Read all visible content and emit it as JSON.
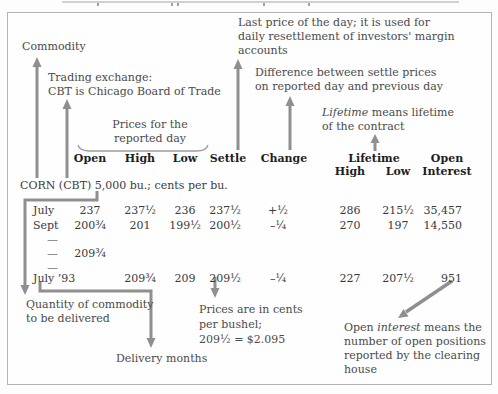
{
  "corn_line": "CORN (CBT) 5,000 bu.; cents per bu.",
  "annotations": {
    "commodity": {
      "text": "Commodity"
    },
    "exchange": {
      "line1": "Trading exchange:",
      "line2": "CBT is Chicago Board of Trade"
    },
    "prices_reported": {
      "line1": "Prices for the",
      "line2": "reported day"
    },
    "settle_note": {
      "line1": "Last price of the day; it is used for",
      "line2": "daily resettlement of investors' margin",
      "line3": "accounts"
    },
    "change_note": {
      "line1": "Difference between settle prices",
      "line2": "on reported day and previous day"
    },
    "lifetime_note": {
      "italic_word": "Lifetime",
      "line1_rest": " means lifetime",
      "line2": "of the contract"
    },
    "quantity_note": {
      "line1": "Quantity of commodity",
      "line2": "to be delivered"
    },
    "delivery_note": {
      "text": "Delivery months"
    },
    "cents_note": {
      "line1": "Prices are in cents",
      "line2": "per bushel;",
      "line3": "209½ = $2.095"
    },
    "open_interest_note": {
      "line1_pre": "Open ",
      "italic_word": "interest",
      "line1_rest": " means the",
      "line2": "number of open positions",
      "line3": "reported by the clearing",
      "line4": "house"
    }
  },
  "table": {
    "headers": {
      "open": "Open",
      "high": "High",
      "low": "Low",
      "settle": "Settle",
      "change": "Change",
      "lifetime": "Lifetime",
      "lifetime_high": "High",
      "lifetime_low": "Low",
      "open_interest_line1": "Open",
      "open_interest_line2": "Interest"
    },
    "rows": [
      {
        "month": "July",
        "open": "237",
        "high": "237½",
        "low": "236",
        "settle": "237½",
        "change": "+½",
        "lt_high": "286",
        "lt_low": "215½",
        "oi": "35,457"
      },
      {
        "month": "Sept",
        "open": "200¾",
        "high": "201",
        "low": "199½",
        "settle": "200½",
        "change": "–¼",
        "lt_high": "270",
        "lt_low": "197",
        "oi": "14,550"
      },
      {
        "month": "—",
        "open": "",
        "high": "",
        "low": "",
        "settle": "",
        "change": "",
        "lt_high": "",
        "lt_low": "",
        "oi": ""
      },
      {
        "month": "—",
        "open": "209¾",
        "high": "",
        "low": "",
        "settle": "",
        "change": "",
        "lt_high": "",
        "lt_low": "",
        "oi": ""
      },
      {
        "month": "—",
        "open": "",
        "high": "",
        "low": "",
        "settle": "",
        "change": "",
        "lt_high": "",
        "lt_low": "",
        "oi": ""
      },
      {
        "month": "July ’93",
        "open": "",
        "high": "209¾",
        "low": "209",
        "settle": "209½",
        "change": "–¼",
        "lt_high": "227",
        "lt_low": "207½",
        "oi": "951"
      }
    ]
  },
  "colors": {
    "arrow": "#8f8f8f",
    "annotation_text": "#4a4a4a",
    "table_text": "#3a3a3a",
    "header_text": "#1d1d1d",
    "frame_border": "#b3b3b3",
    "background": "#fdfdfd"
  }
}
